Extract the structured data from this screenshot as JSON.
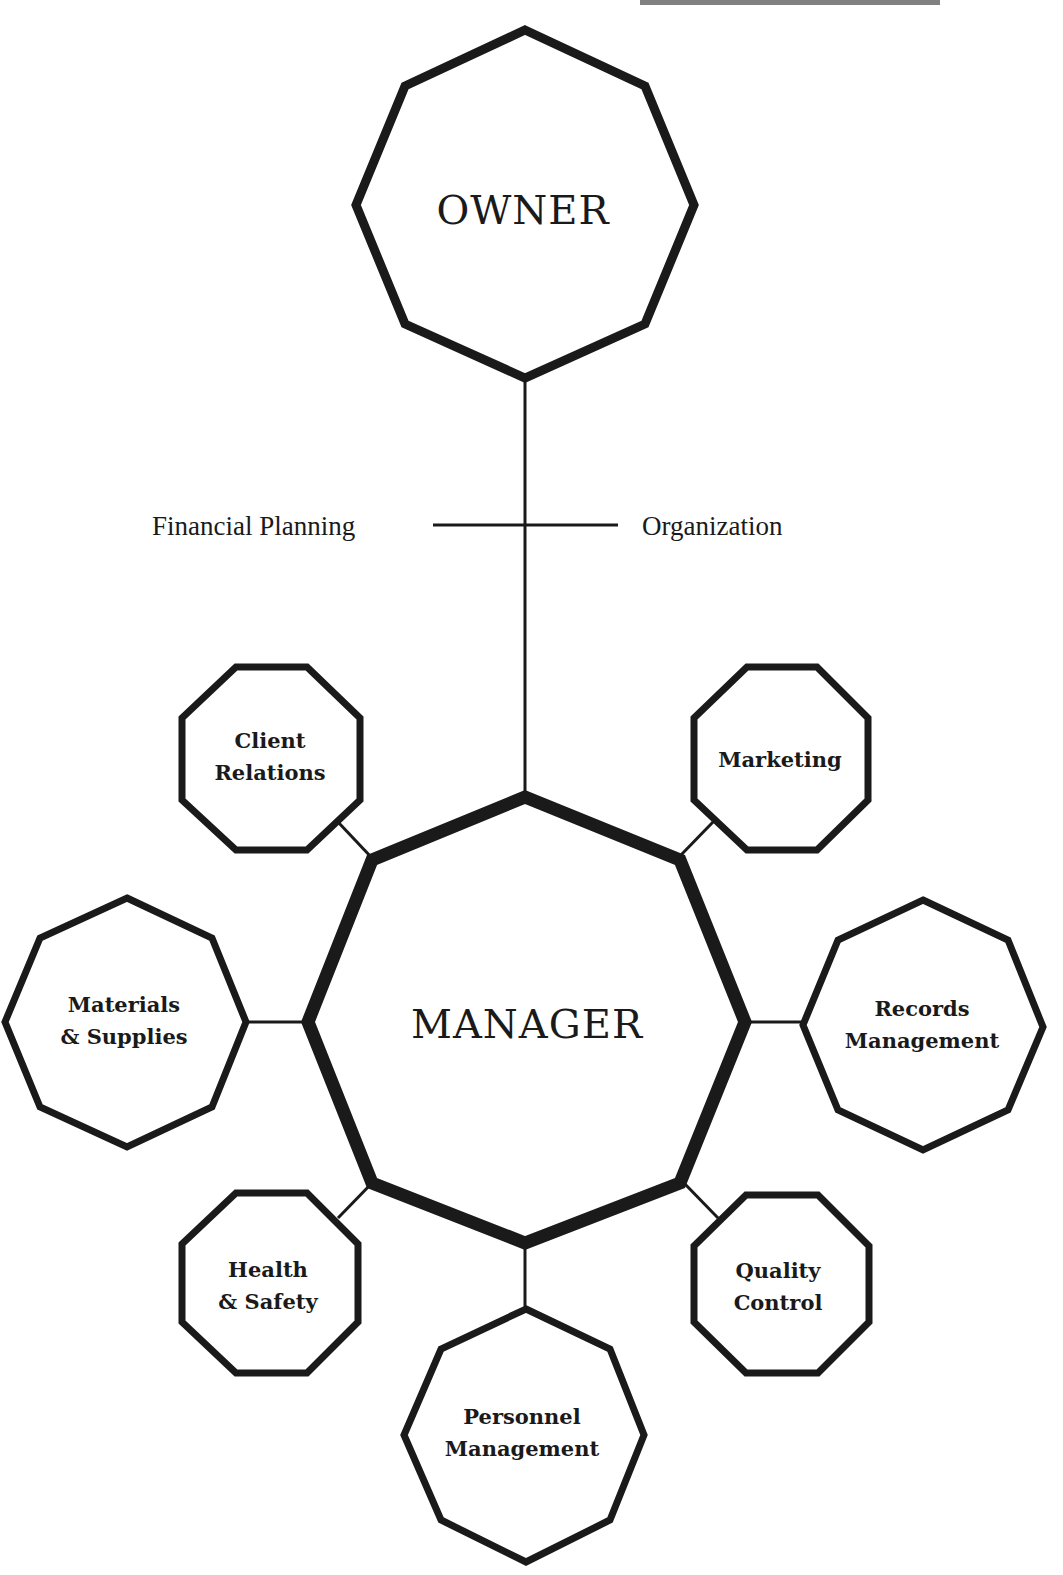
{
  "diagram": {
    "top_heading_cropped": true,
    "owner": {
      "label": "OWNER"
    },
    "manager": {
      "label": "MANAGER"
    },
    "owner_manager_link": {
      "left_label": "Financial Planning",
      "right_label": "Organization"
    },
    "departments": [
      {
        "id": "client-relations",
        "lines": [
          "Client",
          "Relations"
        ]
      },
      {
        "id": "marketing",
        "lines": [
          "Marketing"
        ]
      },
      {
        "id": "materials-supplies",
        "lines": [
          "Materials",
          "& Supplies"
        ]
      },
      {
        "id": "records-management",
        "lines": [
          "Records",
          "Management"
        ]
      },
      {
        "id": "health-safety",
        "lines": [
          "Health",
          "& Safety"
        ]
      },
      {
        "id": "quality-control",
        "lines": [
          "Quality",
          "Control"
        ]
      },
      {
        "id": "personnel-management",
        "lines": [
          "Personnel",
          "Management"
        ]
      }
    ],
    "colors": {
      "stroke": "#1a1a1a",
      "background": "#ffffff"
    }
  }
}
